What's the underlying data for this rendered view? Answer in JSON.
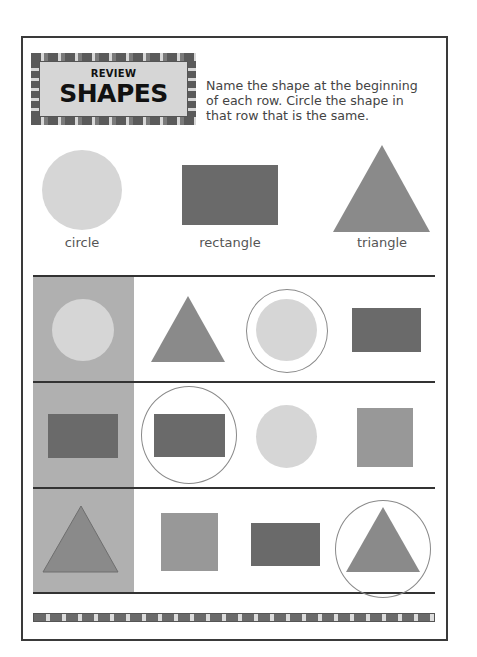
{
  "header": {
    "badge_small": "REVIEW",
    "badge_title": "SHAPES"
  },
  "instructions": {
    "line1": "Name the shape at the beginning",
    "line2": "of each row. Circle the shape in",
    "line3": "that row that is the same."
  },
  "key_shapes": [
    {
      "shape": "circle",
      "label": "circle"
    },
    {
      "shape": "rectangle",
      "label": "rectangle"
    },
    {
      "shape": "triangle",
      "label": "triangle"
    }
  ],
  "rows": [
    {
      "target": "circle",
      "options": [
        "triangle",
        "circle",
        "rectangle"
      ],
      "circled_index": 1
    },
    {
      "target": "rectangle",
      "options": [
        "rectangle",
        "circle",
        "square"
      ],
      "circled_index": 0
    },
    {
      "target": "triangle",
      "options": [
        "square",
        "rectangle",
        "triangle"
      ],
      "circled_index": 2
    }
  ],
  "colors": {
    "circle": "#d6d6d6",
    "rectangle": "#6a6a6a",
    "triangle": "#8a8a8a",
    "square": "#989898",
    "shaded_column": "#b0b0b0",
    "ring": "#8a8a8a"
  }
}
